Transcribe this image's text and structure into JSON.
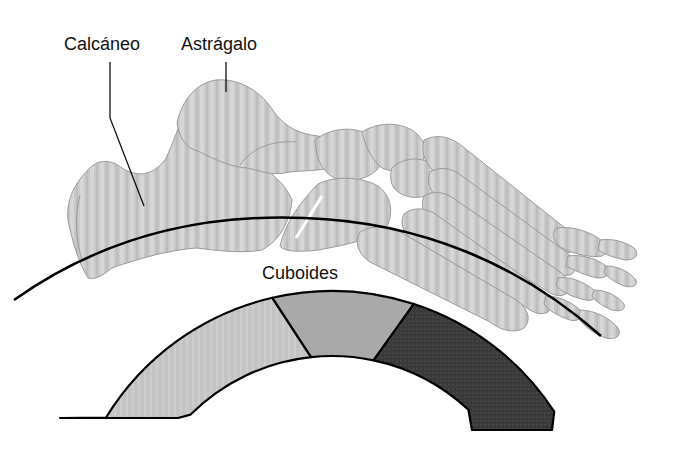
{
  "figure": {
    "labels": {
      "calcaneus": "Calcáneo",
      "talus": "Astrágalo",
      "cuboid": "Cuboides"
    },
    "arch_band": {
      "segments": [
        {
          "id": "posterior",
          "color": "#c2c2c2"
        },
        {
          "id": "middle",
          "color": "#a9a9a9"
        },
        {
          "id": "anterior",
          "color": "#3c3c3c"
        }
      ],
      "outline_color": "#000000"
    },
    "arc_line_color": "#000000",
    "bone_color": "#c8c8c8"
  }
}
